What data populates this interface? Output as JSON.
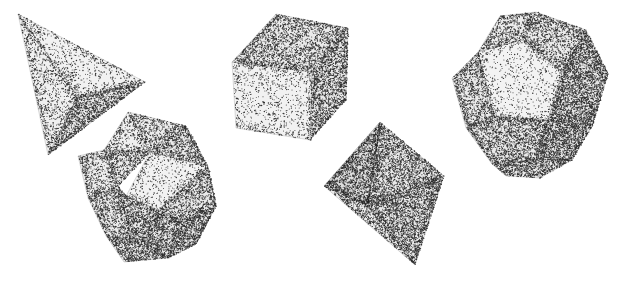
{
  "canvas": {
    "width": 624,
    "height": 282,
    "background_color": "#ffffff",
    "ink_color": "#1a1a1a",
    "render_style": "stipple",
    "title": "Five Platonic solids in stippled pen-and-ink style"
  },
  "solids": [
    {
      "id": "tetrahedron",
      "name": "Tetrahedron",
      "face_count": 4,
      "face_shape": "triangle",
      "position": {
        "x": 18,
        "y": 14,
        "width": 135,
        "height": 145
      },
      "faces": [
        {
          "label": "tetra-face-left",
          "tone": 0.3,
          "points": "18,14 78,96 48,155"
        },
        {
          "label": "tetra-face-front",
          "tone": 0.2,
          "points": "18,14 145,82 78,96"
        },
        {
          "label": "tetra-face-lower",
          "tone": 0.62,
          "points": "78,96 145,82 48,155"
        }
      ]
    },
    {
      "id": "cube",
      "name": "Cube (Hexahedron)",
      "face_count": 6,
      "face_shape": "square",
      "position": {
        "x": 228,
        "y": 12,
        "width": 120,
        "height": 135
      },
      "faces": [
        {
          "label": "cube-face-top",
          "tone": 0.5,
          "points": "232,62 276,14 348,28 312,72"
        },
        {
          "label": "cube-face-front",
          "tone": 0.18,
          "points": "232,62 312,72 310,140 236,128"
        },
        {
          "label": "cube-face-right",
          "tone": 0.58,
          "points": "312,72 348,28 346,100 310,140"
        }
      ]
    },
    {
      "id": "octahedron",
      "name": "Octahedron",
      "face_count": 8,
      "face_shape": "triangle",
      "position": {
        "x": 320,
        "y": 120,
        "width": 125,
        "height": 148
      },
      "faces": [
        {
          "label": "octa-face-upper-left",
          "tone": 0.52,
          "points": "380,122 324,186 368,206"
        },
        {
          "label": "octa-face-front",
          "tone": 0.16,
          "points": "380,122 368,206 324,186"
        },
        {
          "label": "octa-face-upper-right",
          "tone": 0.6,
          "points": "380,122 444,176 368,206"
        },
        {
          "label": "octa-face-lower-left",
          "tone": 0.46,
          "points": "324,186 368,206 415,265"
        },
        {
          "label": "octa-face-lower-right",
          "tone": 0.64,
          "points": "368,206 444,176 415,265"
        }
      ]
    },
    {
      "id": "dodecahedron",
      "name": "Dodecahedron",
      "face_count": 12,
      "face_shape": "pentagon",
      "position": {
        "x": 452,
        "y": 10,
        "width": 158,
        "height": 168
      },
      "faces": [
        {
          "label": "dodeca-face-center",
          "tone": 0.14,
          "points": "478,52 522,40 562,72 548,120 494,116"
        },
        {
          "label": "dodeca-face-top-left",
          "tone": 0.44,
          "points": "478,52 500,16 536,12 522,40"
        },
        {
          "label": "dodeca-face-top-right",
          "tone": 0.48,
          "points": "522,40 536,12 586,30 562,72"
        },
        {
          "label": "dodeca-face-left",
          "tone": 0.5,
          "points": "478,52 494,116 466,128 452,78"
        },
        {
          "label": "dodeca-face-right",
          "tone": 0.7,
          "points": "562,72 586,30 608,74 592,126 548,120"
        },
        {
          "label": "dodeca-face-bottom-left",
          "tone": 0.56,
          "points": "494,116 548,120 536,160 492,164 466,128"
        },
        {
          "label": "dodeca-face-bottom-right",
          "tone": 0.72,
          "points": "548,120 592,126 572,160 536,160"
        },
        {
          "label": "dodeca-face-bottom",
          "tone": 0.58,
          "points": "492,164 536,160 572,160 540,178 506,176"
        }
      ]
    },
    {
      "id": "icosahedron",
      "name": "Icosahedron",
      "face_count": 20,
      "face_shape": "triangle",
      "position": {
        "x": 78,
        "y": 112,
        "width": 138,
        "height": 150
      },
      "faces": [
        {
          "label": "ico-face-a",
          "tone": 0.44,
          "points": "128,112 186,126 150,152"
        },
        {
          "label": "ico-face-b",
          "tone": 0.3,
          "points": "128,112 150,152 104,150"
        },
        {
          "label": "ico-face-c",
          "tone": 0.52,
          "points": "186,126 208,166 150,152"
        },
        {
          "label": "ico-face-d",
          "tone": 0.48,
          "points": "104,150 150,152 118,186"
        },
        {
          "label": "ico-face-e",
          "tone": 0.16,
          "points": "150,152 208,166 158,210 126,196"
        },
        {
          "label": "ico-face-f",
          "tone": 0.4,
          "points": "78,156 104,150 118,186 88,198"
        },
        {
          "label": "ico-face-g",
          "tone": 0.54,
          "points": "208,166 216,206 184,222 158,210"
        },
        {
          "label": "ico-face-h",
          "tone": 0.58,
          "points": "118,186 126,196 158,210 132,240"
        },
        {
          "label": "ico-face-i",
          "tone": 0.5,
          "points": "88,198 118,186 132,240 106,236"
        },
        {
          "label": "ico-face-j",
          "tone": 0.66,
          "points": "132,240 158,210 184,222 168,258"
        },
        {
          "label": "ico-face-k",
          "tone": 0.62,
          "points": "106,236 132,240 168,258 124,262"
        },
        {
          "label": "ico-face-l",
          "tone": 0.68,
          "points": "184,222 216,206 196,244 168,258"
        }
      ]
    }
  ]
}
